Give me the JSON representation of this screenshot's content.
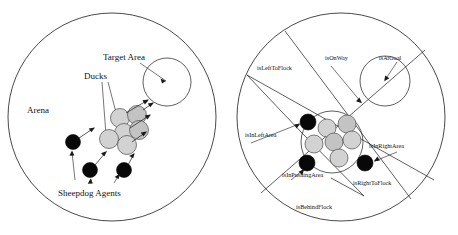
{
  "figure": {
    "panels": [
      {
        "id": "left",
        "name": "arena-overview",
        "labels": {
          "arena": "Arena",
          "ducks": "Ducks",
          "target_area": "Target Area",
          "sheepdog_agents": "Sheepdog Agents"
        },
        "counts": {
          "ducks": 6,
          "agents": 3
        }
      },
      {
        "id": "right",
        "name": "state-regions",
        "labels": {
          "is_left_to_flock": "isLeftToFlock",
          "is_on_way": "isOnWay",
          "is_at_goal": "isAtGoal",
          "is_in_left_area": "isInLeftArea",
          "is_in_right_area": "isInRightArea",
          "is_in_pushing_area": "isInPushingArea",
          "is_right_to_flock": "isRightToFlock",
          "is_behind_flock": "isBehindFlock"
        },
        "counts": {
          "ducks": 6,
          "agents": 3
        }
      }
    ],
    "colors": {
      "stroke": "#1a1a1a",
      "duck_fill": "#d2d2d2",
      "agent_fill": "#080808",
      "background": "#ffffff"
    }
  }
}
